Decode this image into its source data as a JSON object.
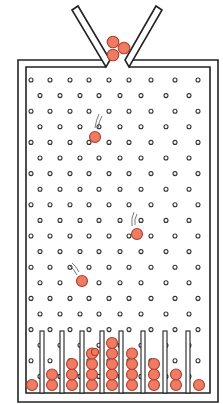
{
  "diagram": {
    "type": "galton-board",
    "colors": {
      "stroke": "#222222",
      "background": "#ffffff",
      "ball_fill": "#f07a62",
      "ball_stroke": "#a8402e"
    },
    "funnel_balls": 3,
    "falling_balls": 3,
    "peg_rows": 20,
    "bins": {
      "count": 9,
      "ball_counts": [
        1,
        2,
        3,
        4,
        5,
        4,
        3,
        2,
        1
      ]
    }
  }
}
